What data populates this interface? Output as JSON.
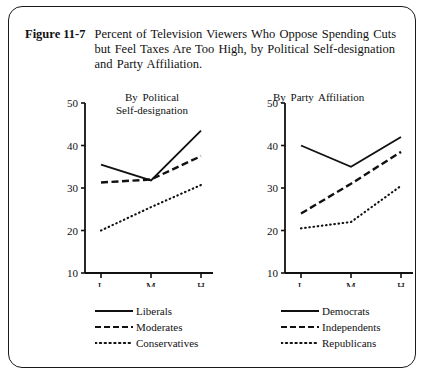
{
  "figure": {
    "label": "Figure 11-7",
    "title": "Percent of Television Viewers Who Oppose Spending Cuts but Feel Taxes Are Too High, by Political Self-designation and Party Affiliation."
  },
  "chart_data": [
    {
      "type": "line",
      "title": "By Political\nSelf-designation",
      "xlabel": "",
      "ylabel": "",
      "categories": [
        "L",
        "M",
        "H"
      ],
      "xticklabels": [
        "L",
        "M",
        "H"
      ],
      "yticklabels": [
        "10",
        "20",
        "30",
        "40",
        "50"
      ],
      "yticks": [
        10,
        20,
        30,
        40,
        50
      ],
      "ylim": [
        10,
        50
      ],
      "grid": false,
      "legend_position": "below",
      "series": [
        {
          "name": "Liberals",
          "style": "solid",
          "values": [
            35.5,
            31.8,
            43.5
          ]
        },
        {
          "name": "Moderates",
          "style": "dashed",
          "values": [
            31.3,
            32.0,
            37.5
          ]
        },
        {
          "name": "Conservatives",
          "style": "dotted",
          "values": [
            20.0,
            25.5,
            30.7
          ]
        }
      ]
    },
    {
      "type": "line",
      "title": "By Party Affiliation",
      "xlabel": "",
      "ylabel": "",
      "categories": [
        "L",
        "M",
        "H"
      ],
      "xticklabels": [
        "L",
        "M",
        "H"
      ],
      "yticklabels": [
        "10",
        "20",
        "30",
        "40",
        "50"
      ],
      "yticks": [
        10,
        20,
        30,
        40,
        50
      ],
      "ylim": [
        10,
        50
      ],
      "grid": false,
      "legend_position": "below",
      "series": [
        {
          "name": "Democrats",
          "style": "solid",
          "values": [
            40.0,
            35.0,
            42.0
          ]
        },
        {
          "name": "Independents",
          "style": "dashed",
          "values": [
            24.0,
            31.0,
            38.5
          ]
        },
        {
          "name": "Republicans",
          "style": "dotted",
          "values": [
            20.5,
            22.0,
            30.5
          ]
        }
      ]
    }
  ]
}
